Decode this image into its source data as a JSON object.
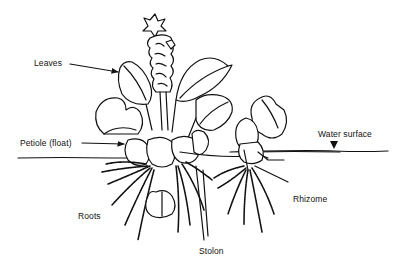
{
  "diagram": {
    "labels": {
      "leaves": "Leaves",
      "petiole": "Petiole (float)",
      "water_surface": "Water surface",
      "rhizome": "Rhizome",
      "roots": "Roots",
      "stolon": "Stolon"
    },
    "colors": {
      "ink": "#111111",
      "background": "#ffffff"
    },
    "markers": {
      "water_surface_marker": "down-triangle"
    }
  }
}
